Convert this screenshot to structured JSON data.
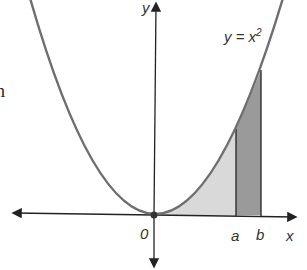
{
  "diagram": {
    "type": "function-graph",
    "function_label": "y = x",
    "function_exponent": "2",
    "x_axis_label": "x",
    "y_axis_label": "y",
    "origin_label": "0",
    "bound_a_label": "a",
    "bound_b_label": "b",
    "clipped_margin_text": "n",
    "colors": {
      "curve": "#6e6e6e",
      "axes": "#222222",
      "region_light": "#d9d9d9",
      "region_dark": "#9a9a9a"
    }
  }
}
